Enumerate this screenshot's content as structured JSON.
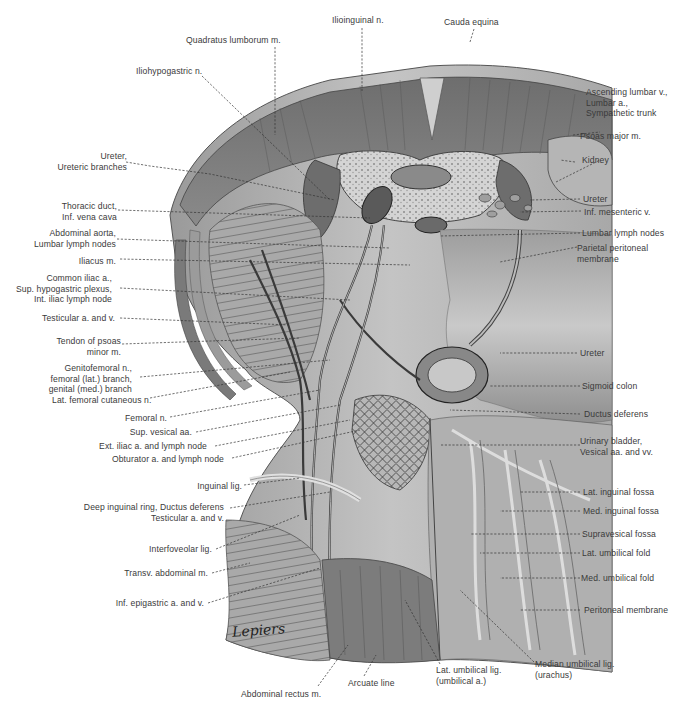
{
  "figure": {
    "type": "anatomical illustration",
    "artist_signature": "Lepiers"
  },
  "labels_top": [
    {
      "id": "quadratus-lumborum",
      "text": "Quadratus lumborum m."
    },
    {
      "id": "ilioinguinal-n",
      "text": "Ilioinguinal n."
    },
    {
      "id": "cauda-equina",
      "text": "Cauda equina"
    },
    {
      "id": "iliohypogastric-n",
      "text": "Iliohypogastric n."
    }
  ],
  "labels_left": [
    {
      "id": "ureter-branches",
      "lines": [
        "Ureter,",
        "Ureteric branches"
      ]
    },
    {
      "id": "thoracic-duct",
      "lines": [
        "Thoracic duct,",
        "Inf. vena cava"
      ]
    },
    {
      "id": "abdominal-aorta",
      "lines": [
        "Abdominal aorta,",
        "Lumbar lymph nodes"
      ]
    },
    {
      "id": "iliacus-m",
      "lines": [
        "Iliacus m."
      ]
    },
    {
      "id": "common-iliac",
      "lines": [
        "Common iliac a.,",
        "Sup. hypogastric plexus,",
        "Int. iliac lymph node"
      ]
    },
    {
      "id": "testicular-av",
      "lines": [
        "Testicular a. and v."
      ]
    },
    {
      "id": "tendon-psoas-minor",
      "lines": [
        "Tendon of psoas",
        "minor m."
      ]
    },
    {
      "id": "genitofemoral-n",
      "lines": [
        "Genitofemoral n.,",
        "femoral (lat.) branch,",
        "genital (med.) branch"
      ]
    },
    {
      "id": "lat-femoral-cutaneous",
      "lines": [
        "Lat. femoral cutaneous n."
      ]
    },
    {
      "id": "femoral-n",
      "lines": [
        "Femoral n."
      ]
    },
    {
      "id": "sup-vesical",
      "lines": [
        "Sup. vesical aa."
      ]
    },
    {
      "id": "ext-iliac",
      "lines": [
        "Ext. iliac a. and lymph node"
      ]
    },
    {
      "id": "obturator",
      "lines": [
        "Obturator a. and lymph node"
      ]
    },
    {
      "id": "inguinal-lig",
      "lines": [
        "Inguinal lig."
      ]
    },
    {
      "id": "deep-inguinal-ring",
      "lines": [
        "Deep inguinal ring, Ductus deferens",
        "Testicular a. and v."
      ]
    },
    {
      "id": "interfoveolar-lig",
      "lines": [
        "Interfoveolar lig."
      ]
    },
    {
      "id": "transv-abdominal",
      "lines": [
        "Transv. abdominal m."
      ]
    },
    {
      "id": "inf-epigastric",
      "lines": [
        "Inf. epigastric a. and v."
      ]
    }
  ],
  "labels_right": [
    {
      "id": "ascending-lumbar",
      "lines": [
        "Ascending lumbar v.,",
        "Lumbar a.,",
        "Sympathetic trunk"
      ]
    },
    {
      "id": "psoas-major",
      "lines": [
        "Psoas major m."
      ]
    },
    {
      "id": "kidney",
      "lines": [
        "Kidney"
      ]
    },
    {
      "id": "ureter-upper",
      "lines": [
        "Ureter"
      ]
    },
    {
      "id": "inf-mesenteric",
      "lines": [
        "Inf. mesenteric v."
      ]
    },
    {
      "id": "lumbar-lymph",
      "lines": [
        "Lumbar lymph nodes"
      ]
    },
    {
      "id": "parietal-peritoneal",
      "lines": [
        "Parietal peritoneal",
        "membrane"
      ]
    },
    {
      "id": "ureter-lower",
      "lines": [
        "Ureter"
      ]
    },
    {
      "id": "sigmoid-colon",
      "lines": [
        "Sigmoid colon"
      ]
    },
    {
      "id": "ductus-deferens",
      "lines": [
        "Ductus deferens"
      ]
    },
    {
      "id": "urinary-bladder",
      "lines": [
        "Urinary bladder,",
        "Vesical aa. and vv."
      ]
    },
    {
      "id": "lat-inguinal-fossa",
      "lines": [
        "Lat. inguinal fossa"
      ]
    },
    {
      "id": "med-inguinal-fossa",
      "lines": [
        "Med. inguinal fossa"
      ]
    },
    {
      "id": "supravesical-fossa",
      "lines": [
        "Supravesical fossa"
      ]
    },
    {
      "id": "lat-umbilical-fold",
      "lines": [
        "Lat. umbilical fold"
      ]
    },
    {
      "id": "med-umbilical-fold",
      "lines": [
        "Med. umbilical fold"
      ]
    },
    {
      "id": "peritoneal-membrane",
      "lines": [
        "Peritoneal membrane"
      ]
    }
  ],
  "labels_bottom": [
    {
      "id": "abdominal-rectus",
      "lines": [
        "Abdominal rectus m."
      ]
    },
    {
      "id": "arcuate-line",
      "lines": [
        "Arcuate line"
      ]
    },
    {
      "id": "lat-umbilical-lig",
      "lines": [
        "Lat. umbilical lig.",
        "(umbilical a.)"
      ]
    },
    {
      "id": "median-umbilical-lig",
      "lines": [
        "Median umbilical lig.",
        "(urachus)"
      ]
    }
  ]
}
